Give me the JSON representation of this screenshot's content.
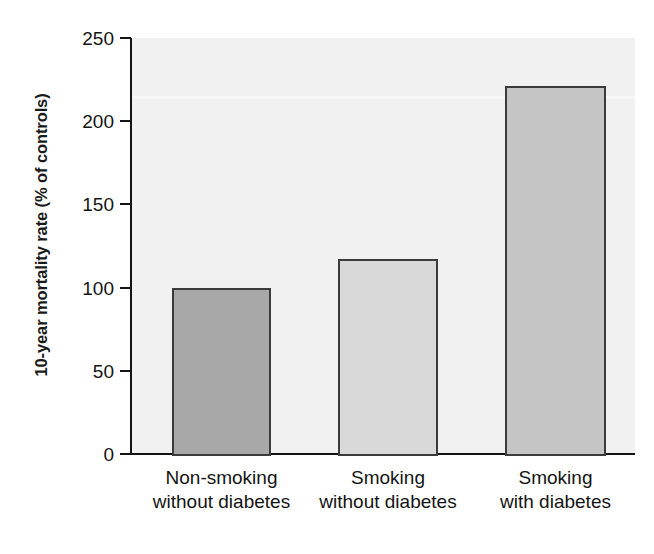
{
  "chart_data": {
    "type": "bar",
    "title": "",
    "subtitle": "",
    "xlabel": "",
    "ylabel": "10-year mortality rate (% of controls)",
    "categories": [
      "Non-smoking without diabetes",
      "Smoking without diabetes",
      "Smoking with diabetes"
    ],
    "category_lines": [
      [
        "Non-smoking",
        "without diabetes"
      ],
      [
        "Smoking",
        "without diabetes"
      ],
      [
        "Smoking",
        "with diabetes"
      ]
    ],
    "values": [
      100,
      117,
      221
    ],
    "ylim": [
      0,
      250
    ],
    "yticks": [
      0,
      50,
      100,
      150,
      200,
      250
    ],
    "ytick_labels": [
      "0",
      "50",
      "100",
      "150",
      "200",
      "250"
    ],
    "grid": false,
    "legend": "none",
    "bar_colors": [
      "#a8a8a8",
      "#d9d9d9",
      "#c5c5c5"
    ],
    "bar_edge_color": "#3b3b3b",
    "plot_background_color": "#f1f1f1",
    "figure_background_color": "#ffffff",
    "axis_color": "#141414"
  },
  "axis": {
    "y_title": "10-year mortality rate (% of controls)"
  }
}
